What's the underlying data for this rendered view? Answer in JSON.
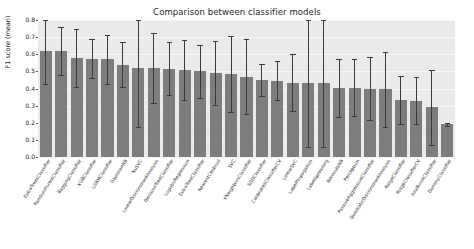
{
  "chart_data": {
    "type": "bar",
    "title": "Comparison between classifier models",
    "xlabel": "",
    "ylabel": "F1 score (mean)",
    "ylim": [
      0.0,
      0.8
    ],
    "yticks": [
      "0.0",
      "0.1",
      "0.2",
      "0.3",
      "0.4",
      "0.5",
      "0.6",
      "0.7",
      "0.8"
    ],
    "grid": true,
    "legend": null,
    "orientation": "vertical",
    "bar_color": "#7d7d7d",
    "error_color": "#3a3a3a",
    "axes_facecolor": "#eaeaea",
    "categories": [
      "ExtraTreesClassifier",
      "RandomForestClassifier",
      "BaggingClassifier",
      "XGBClassifier",
      "LGBMClassifier",
      "GaussianNB",
      "NuSVC",
      "LinearDiscriminantAnalysis",
      "DecisionTreeClassifier",
      "LogisticRegression",
      "ExtraTreeClassifier",
      "NearestCentroid",
      "SVC",
      "KNeighborsClassifier",
      "SGDClassifier",
      "CalibratedClassifierCV",
      "LinearSVC",
      "LabelPropagation",
      "LabelSpreading",
      "BernoulliNB",
      "Perceptron",
      "PassiveAggressiveClassifier",
      "QuadraticDiscriminantAnalysis",
      "RidgeClassifier",
      "RidgeClassifierCV",
      "AdaBoostClassifier",
      "DummyClassifier"
    ],
    "values": [
      0.62,
      0.62,
      0.58,
      0.575,
      0.57,
      0.54,
      0.52,
      0.52,
      0.515,
      0.51,
      0.5,
      0.49,
      0.485,
      0.47,
      0.45,
      0.445,
      0.435,
      0.435,
      0.435,
      0.405,
      0.405,
      0.4,
      0.395,
      0.335,
      0.33,
      0.29,
      0.19
    ],
    "errors": [
      0.195,
      0.14,
      0.17,
      0.115,
      0.145,
      0.13,
      0.345,
      0.205,
      0.155,
      0.175,
      0.155,
      0.185,
      0.22,
      0.22,
      0.095,
      0.115,
      0.165,
      0.375,
      0.375,
      0.17,
      0.165,
      0.185,
      0.22,
      0.14,
      0.135,
      0.22,
      0.01
    ]
  }
}
